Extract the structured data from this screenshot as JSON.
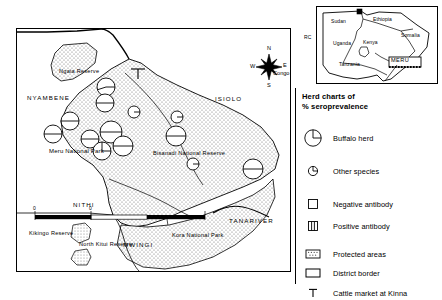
{
  "figure": {
    "type": "thematic-map",
    "region": "Meru National Park area, Kenya"
  },
  "main_map": {
    "district_labels": [
      {
        "text": "NYAMBENE",
        "x": 10,
        "y": 68
      },
      {
        "text": "ISIOLO",
        "x": 198,
        "y": 69
      },
      {
        "text": "NITHI",
        "x": 72,
        "y": 175
      },
      {
        "text": "MWINGI",
        "x": 114,
        "y": 218
      },
      {
        "text": "TANARIVER",
        "x": 214,
        "y": 192
      }
    ],
    "place_labels": [
      {
        "text": "Ngaia Reserve",
        "x": 44,
        "y": 42
      },
      {
        "text": "Meru National Park",
        "x": 36,
        "y": 123
      },
      {
        "text": "Bisanadi National Reserve",
        "x": 140,
        "y": 124
      },
      {
        "text": "Kikingo Reserve",
        "x": 10,
        "y": 204
      },
      {
        "text": "North Kitui Reserve",
        "x": 64,
        "y": 215
      },
      {
        "text": "Kora National Park",
        "x": 157,
        "y": 206
      }
    ],
    "cattle_market_marker": {
      "label": "T",
      "x": 120,
      "y": 38
    },
    "compass": {
      "north": "N",
      "south": "S",
      "east": "E",
      "west": "W",
      "extra_label": "Congo",
      "x": 258,
      "y": 30
    },
    "scale_bar": {
      "ticks": [
        "0",
        "0"
      ],
      "x": 18,
      "y": 182
    },
    "herd_charts": [
      {
        "id": "h1",
        "x": 89,
        "y": 58,
        "r": 9,
        "kind": "buffalo",
        "seroprevalence": 55
      },
      {
        "id": "h2",
        "x": 88,
        "y": 74,
        "r": 9,
        "kind": "buffalo",
        "seroprevalence": 50
      },
      {
        "id": "h3",
        "x": 53,
        "y": 92,
        "r": 9,
        "kind": "buffalo",
        "seroprevalence": 50
      },
      {
        "id": "h4",
        "x": 36,
        "y": 105,
        "r": 9,
        "kind": "buffalo",
        "seroprevalence": 50
      },
      {
        "id": "h5",
        "x": 73,
        "y": 110,
        "r": 9,
        "kind": "buffalo",
        "seroprevalence": 50
      },
      {
        "id": "h6",
        "x": 94,
        "y": 103,
        "r": 11,
        "kind": "buffalo",
        "seroprevalence": 50
      },
      {
        "id": "h7",
        "x": 85,
        "y": 122,
        "r": 9,
        "kind": "buffalo",
        "seroprevalence": 100
      },
      {
        "id": "h8",
        "x": 106,
        "y": 117,
        "r": 10,
        "kind": "buffalo",
        "seroprevalence": 50
      },
      {
        "id": "h9",
        "x": 159,
        "y": 107,
        "r": 10,
        "kind": "buffalo",
        "seroprevalence": 50
      },
      {
        "id": "h10",
        "x": 160,
        "y": 88,
        "r": 6,
        "kind": "other",
        "seroprevalence": 0
      },
      {
        "id": "h11",
        "x": 117,
        "y": 83,
        "r": 6,
        "kind": "other",
        "seroprevalence": 0
      },
      {
        "id": "h12",
        "x": 176,
        "y": 135,
        "r": 6,
        "kind": "other",
        "seroprevalence": 0
      },
      {
        "id": "h13",
        "x": 236,
        "y": 140,
        "r": 10,
        "kind": "buffalo",
        "seroprevalence": 50
      }
    ]
  },
  "inset_map": {
    "countries": [
      {
        "text": "Sudan",
        "x": 16,
        "y": 14
      },
      {
        "text": "Ethiopia",
        "x": 57,
        "y": 12
      },
      {
        "text": "Somalia",
        "x": 86,
        "y": 29
      },
      {
        "text": "Uganda",
        "x": 17,
        "y": 37
      },
      {
        "text": "Kenya",
        "x": 48,
        "y": 36
      },
      {
        "text": "Tanzania",
        "x": 24,
        "y": 58
      }
    ],
    "highlight_box_label": "MERU",
    "edge_label": "RC"
  },
  "legend": {
    "title_line1": "Herd charts of",
    "title_line2": "%   seroprevalence",
    "items": [
      {
        "symbol": "large-circle-pie",
        "label": "Buffalo herd"
      },
      {
        "symbol": "small-circle-pie",
        "label": "Other species"
      },
      {
        "symbol": "empty-square",
        "label": "Negative antibody"
      },
      {
        "symbol": "split-square",
        "label": "Positive antibody"
      },
      {
        "symbol": "stippled-square",
        "label": "Protected areas"
      },
      {
        "symbol": "outline-square",
        "label": "District border"
      },
      {
        "symbol": "tee-marker",
        "label": "Cattle market at Kinna"
      }
    ]
  },
  "colors": {
    "ink": "#000000",
    "paper": "#ffffff",
    "stipple": "#7a7a7a"
  }
}
